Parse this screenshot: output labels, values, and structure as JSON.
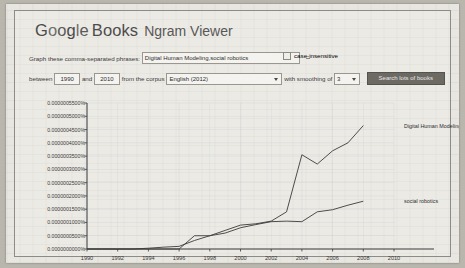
{
  "header": {
    "google_g": "G",
    "google_o1": "o",
    "google_o2": "o",
    "google_g2": "g",
    "google_l": "l",
    "google_e": "e",
    "books": "Books",
    "ngram_viewer": "Ngram Viewer"
  },
  "form": {
    "phrases_label": "Graph these comma-separated phrases:",
    "phrases_value": "Digital Human Modeling,social robotics",
    "phrases_placeholder": "",
    "case_insensitive_label": "case-insensitive",
    "case_insensitive_checked": "false",
    "between_label": "between",
    "year_start": "1990",
    "and_label": "and",
    "year_end": "2010",
    "corpus_label": "from the corpus",
    "corpus_value": "English (2012)",
    "smoothing_label": "with smoothing of",
    "smoothing_value": "3",
    "search_button": "Search lots of books"
  },
  "chart_data": {
    "type": "line",
    "title": "",
    "xlabel": "",
    "ylabel": "",
    "xlim": [
      1990,
      2010
    ],
    "ylim": [
      0.0,
      5.5e-07
    ],
    "grid": true,
    "legend_position": "right-inline",
    "x": [
      1990,
      1991,
      1992,
      1993,
      1994,
      1995,
      1996,
      1997,
      1998,
      1999,
      2000,
      2001,
      2002,
      2003,
      2004,
      2005,
      2006,
      2007,
      2008
    ],
    "xticks": [
      "1990",
      "1992",
      "1994",
      "1996",
      "1998",
      "2000",
      "2002",
      "2004",
      "2006",
      "2008",
      "2010"
    ],
    "yticks": [
      "0.0000000000%",
      "0.0000000500%",
      "0.0000001000%",
      "0.0000001500%",
      "0.0000002000%",
      "0.0000002500%",
      "0.0000003000%",
      "0.0000003500%",
      "0.0000004000%",
      "0.0000004500%",
      "0.0000005000%",
      "0.0000005500%"
    ],
    "series": [
      {
        "name": "Digital Human Modeling",
        "color": "#3b3b3b",
        "values": [
          0.0,
          0.0,
          0.0,
          0.0,
          0.0,
          0.0,
          0.0,
          5e-08,
          5e-08,
          7e-08,
          9e-08,
          9.5e-08,
          1.05e-07,
          1.4e-07,
          3.55e-07,
          3.2e-07,
          3.7e-07,
          4e-07,
          4.65e-07
        ]
      },
      {
        "name": "social robotics",
        "color": "#3b3b3b",
        "values": [
          0.0,
          0.0,
          0.0,
          0.0,
          3e-09,
          7e-09,
          1e-08,
          3.2e-08,
          5e-08,
          6e-08,
          8e-08,
          9.2e-08,
          1.03e-07,
          1.05e-07,
          1.03e-07,
          1.4e-07,
          1.48e-07,
          1.65e-07,
          1.8e-07
        ]
      }
    ]
  }
}
